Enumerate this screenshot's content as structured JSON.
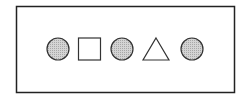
{
  "diagram": {
    "frame": {
      "stroke": "#222222",
      "fill": "#ffffff"
    },
    "shapes": [
      {
        "kind": "circle",
        "filled": true,
        "fill": "#c8c8c8"
      },
      {
        "kind": "square",
        "filled": false,
        "fill": "#ffffff"
      },
      {
        "kind": "circle",
        "filled": true,
        "fill": "#c8c8c8"
      },
      {
        "kind": "triangle",
        "filled": false,
        "fill": "#ffffff"
      },
      {
        "kind": "circle",
        "filled": true,
        "fill": "#c8c8c8"
      }
    ],
    "stroke": "#333333"
  }
}
